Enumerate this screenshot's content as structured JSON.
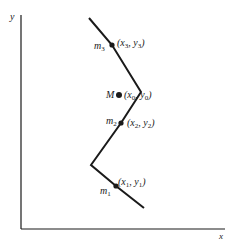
{
  "diagram": {
    "colors": {
      "ink": "#1a1a1a",
      "background": "#ffffff"
    },
    "axes": {
      "x_label": "x",
      "y_label": "y"
    },
    "curve": {
      "points": [
        [
          89,
          18
        ],
        [
          112,
          45
        ],
        [
          141,
          92
        ],
        [
          121,
          123
        ],
        [
          91,
          165
        ],
        [
          116,
          186
        ],
        [
          144,
          208
        ]
      ]
    },
    "masses": [
      {
        "name": "m",
        "sub": "3",
        "coord_open": "(x",
        "coord_sub1": "3",
        "coord_mid": ", y",
        "coord_sub2": "3",
        "coord_close": ")"
      },
      {
        "name": "m",
        "sub": "2",
        "coord_open": "(x",
        "coord_sub1": "2",
        "coord_mid": ", y",
        "coord_sub2": "2",
        "coord_close": ")"
      },
      {
        "name": "m",
        "sub": "1",
        "coord_open": "(x",
        "coord_sub1": "1",
        "coord_mid": ", y",
        "coord_sub2": "1",
        "coord_close": ")"
      }
    ],
    "center": {
      "name": "M",
      "coord_open": "(x",
      "coord_sub1": "0",
      "coord_mid": ", y",
      "coord_sub2": "0",
      "coord_close": ")"
    }
  }
}
